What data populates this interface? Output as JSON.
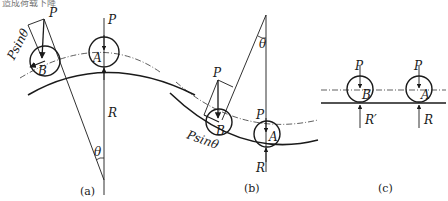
{
  "header": {
    "partial_text": "造成荷载下降"
  },
  "panels": [
    {
      "caption": "(a)",
      "labels": {
        "P_B": "P",
        "P_A": "P",
        "Psin": "Psinθ",
        "B": "B",
        "A": "A",
        "R": "R",
        "theta": "θ"
      }
    },
    {
      "caption": "(b)",
      "labels": {
        "P_B": "P",
        "P_A": "P",
        "Psin": "Psinθ",
        "B": "B",
        "A": "A",
        "R": "R",
        "theta": "θ"
      }
    },
    {
      "caption": "(c)",
      "labels": {
        "P_B": "P",
        "P_A": "P",
        "B": "B",
        "A": "A",
        "R_B": "R′",
        "R_A": "R"
      }
    }
  ]
}
